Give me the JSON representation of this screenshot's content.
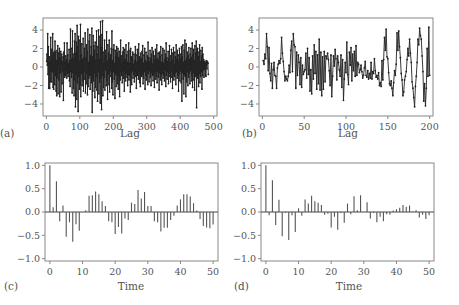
{
  "chart_data": [
    {
      "id": "a",
      "panel_label": "(a)",
      "type": "line",
      "title": "",
      "xlabel": "Lag",
      "ylabel": "",
      "xlim": [
        -10,
        510
      ],
      "ylim": [
        -5.3,
        5.3
      ],
      "xticks": [
        0,
        100,
        200,
        300,
        400,
        500
      ],
      "yticks": [
        -4,
        -2,
        0,
        2,
        4
      ],
      "markers": true,
      "n_points": 500,
      "series_description": "Oscillating time series of 500 points, values roughly between -5 and 5",
      "values": [
        0.6,
        1.4,
        0.2,
        3.6,
        -0.8,
        2.2,
        -2.3,
        0.4,
        1.1,
        -2.3,
        0.5,
        -1.6,
        3.2,
        -0.4,
        1.9,
        -1.6,
        0.8,
        -0.5,
        3.6,
        -2.2,
        1.5,
        -2.4,
        0.2,
        1.7,
        -1.9,
        2.8,
        -0.9,
        1.6,
        -2.6,
        0.7,
        -3.1,
        1.8,
        -1.2,
        2.3,
        -2.9,
        0.3,
        1.5,
        -1.4,
        2.0,
        -3.2,
        0.9,
        -0.6,
        1.7,
        -2.7,
        0.4,
        1.4,
        -1.8,
        0.6,
        -0.4,
        1.1,
        -3.6,
        1.6,
        -0.8,
        2.6,
        -1.1,
        0.5,
        -0.9,
        1.2,
        -0.3,
        0.8,
        -1.2,
        2.6,
        -0.7,
        1.3,
        -1.0,
        0.4,
        -0.6,
        1.9,
        -1.5,
        0.7,
        -2.1,
        4.1,
        -0.5,
        2.0,
        -1.1,
        0.8,
        -2.8,
        3.9,
        -0.6,
        1.4,
        -2.3,
        0.9,
        -3.1,
        2.8,
        -1.4,
        3.6,
        -4.3,
        1.5,
        -0.8,
        2.7,
        -3.5,
        4.5,
        -1.7,
        2.2,
        -4.8,
        3.3,
        -1.0,
        0.6,
        -2.4,
        2.9,
        -1.9,
        4.6,
        -3.2,
        1.3,
        -0.7,
        2.5,
        -2.0,
        0.8,
        -1.5,
        3.1,
        -2.6,
        1.0,
        -0.4,
        2.0,
        -1.3,
        3.7,
        -2.8,
        0.9,
        -1.8,
        2.4,
        -0.6,
        1.7,
        -3.0,
        4.1,
        -2.1,
        0.5,
        -1.2,
        2.8,
        -0.9,
        3.5,
        -2.4,
        1.2,
        -0.8,
        2.2,
        -1.7,
        4.2,
        -4.9,
        1.1,
        -2.6,
        3.4,
        -1.5,
        2.3,
        -0.6,
        1.8,
        -3.3,
        2.7,
        -2.2,
        0.7,
        -1.0,
        3.9,
        -2.5,
        1.4,
        -3.7,
        2.2,
        -0.5,
        4.0,
        -2.9,
        0.8,
        -1.6,
        3.3,
        -3.9,
        4.9,
        -1.2,
        2.1,
        -4.6,
        3.5,
        -0.9,
        5.0,
        -3.1,
        1.6,
        -2.2,
        0.4,
        -1.1,
        2.9,
        -2.5,
        1.8,
        -0.3,
        1.2,
        -2.0,
        3.8,
        -1.4,
        0.6,
        -3.5,
        2.4,
        -0.7,
        1.5,
        -1.9,
        2.9,
        -2.7,
        0.9,
        -0.4,
        1.3,
        -1.0,
        2.0,
        -2.3,
        3.9,
        -1.6,
        0.7,
        -3.0,
        1.9,
        -0.5,
        2.4,
        -1.3,
        0.4,
        -3.4,
        1.8,
        -0.8,
        1.1,
        -2.1,
        2.2,
        -0.6,
        1.5,
        -1.8,
        2.0,
        -2.4,
        1.0,
        -0.9,
        1.7,
        -3.2,
        0.8,
        -1.4,
        2.9,
        -0.5,
        1.2,
        -0.9,
        0.3,
        -1.7,
        1.6,
        -0.4,
        2.1,
        -1.2,
        0.6,
        -2.6,
        1.9,
        -0.3,
        0.8,
        -1.5,
        2.4,
        -0.7,
        1.3,
        -1.1,
        0.5,
        -2.0,
        1.7,
        -0.8,
        2.6,
        -1.4,
        0.4,
        -0.9,
        1.8,
        -2.7,
        2.0,
        -0.6,
        1.1,
        -1.9,
        0.9,
        -0.4,
        1.6,
        -1.2,
        0.3,
        -0.8,
        1.4,
        -1.6,
        0.7,
        -0.5,
        2.2,
        -1.0,
        1.3,
        -2.3,
        0.5,
        -0.7,
        1.9,
        -0.9,
        0.6,
        -1.3,
        2.5,
        -0.4,
        1.1,
        -1.7,
        0.8,
        -2.1,
        1.5,
        -0.6,
        0.9,
        -1.0,
        1.7,
        -0.8,
        2.3,
        -1.8,
        0.4,
        -1.2,
        1.3,
        -0.5,
        2.0,
        -2.4,
        0.7,
        -0.9,
        1.6,
        -1.4,
        0.5,
        -0.3,
        1.2,
        -1.9,
        2.7,
        -0.7,
        1.0,
        -1.6,
        0.6,
        -0.4,
        1.8,
        -1.1,
        0.9,
        -2.0,
        1.4,
        -0.6,
        2.1,
        -0.9,
        0.3,
        -1.5,
        1.7,
        -0.8,
        1.2,
        -2.2,
        0.8,
        -0.5,
        1.9,
        -1.3,
        0.6,
        -1.0,
        2.4,
        -1.7,
        0.9,
        -0.4,
        1.5,
        -1.1,
        0.7,
        -2.5,
        1.6,
        -0.6,
        1.1,
        -1.4,
        2.2,
        -0.8,
        0.5,
        -1.9,
        1.3,
        -0.7,
        2.0,
        -1.2,
        0.4,
        -0.9,
        1.8,
        -1.5,
        0.8,
        -0.3,
        1.4,
        -2.1,
        2.6,
        -0.9,
        1.0,
        -1.3,
        0.6,
        -0.5,
        1.7,
        -1.8,
        0.9,
        -0.7,
        2.3,
        -1.0,
        0.5,
        -1.6,
        1.2,
        -0.4,
        1.9,
        -1.1,
        0.7,
        -2.3,
        1.5,
        -0.8,
        2.1,
        -1.4,
        0.3,
        -1.0,
        1.6,
        -0.6,
        1.1,
        -1.9,
        2.4,
        -0.5,
        0.8,
        -1.2,
        1.8,
        -0.9,
        0.6,
        -2.6,
        1.3,
        -0.7,
        2.0,
        -1.5,
        0.9,
        -0.4,
        1.4,
        -1.7,
        2.2,
        -3.7,
        1.1,
        -0.6,
        2.4,
        -1.3,
        0.5,
        -2.9,
        1.8,
        -0.8,
        2.9,
        -1.0,
        0.7,
        -3.2,
        2.5,
        -1.6,
        0.9,
        -0.5,
        1.6,
        -2.0,
        1.2,
        -1.1,
        2.1,
        -0.7,
        0.8,
        -1.8,
        1.4,
        -0.4,
        2.0,
        -1.5,
        1.0,
        -0.9,
        2.6,
        -2.2,
        1.3,
        -0.6,
        1.9,
        -1.4,
        0.7,
        -2.5,
        2.3,
        -1.0,
        1.5,
        -0.8,
        2.8,
        -4.4,
        1.9,
        -1.2,
        2.0,
        -0.9,
        1.1,
        -2.1,
        1.6,
        -0.7,
        2.4,
        -1.7,
        0.6,
        -1.0,
        1.8,
        -0.5,
        1.2,
        -2.4,
        2.1,
        -0.9,
        1.4,
        -0.3,
        0.8,
        -1.1,
        0.6,
        -0.2,
        0.4,
        -0.9,
        0.5,
        -1.0,
        0.7,
        0.3,
        -0.2,
        0.6,
        0.5,
        0.4,
        -0.8
      ]
    },
    {
      "id": "b",
      "panel_label": "(b)",
      "type": "line",
      "title": "",
      "xlabel": "Lag",
      "ylabel": "",
      "xlim": [
        -4,
        204
      ],
      "ylim": [
        -5.3,
        5.3
      ],
      "xticks": [
        0,
        50,
        100,
        150,
        200
      ],
      "yticks": [
        -4,
        -2,
        0,
        2,
        4
      ],
      "markers": true,
      "n_points": 200,
      "values": [
        0.7,
        0.3,
        1.4,
        0.9,
        3.6,
        2.2,
        -0.4,
        2.1,
        -0.7,
        -1.5,
        0.4,
        -2.3,
        -0.3,
        0.5,
        -0.9,
        -1.0,
        -2.3,
        -0.1,
        0.3,
        0.7,
        0.4,
        0.9,
        3.2,
        1.5,
        0.6,
        -0.5,
        -1.5,
        -1.0,
        -1.3,
        -1.5,
        -1.0,
        0.2,
        -0.6,
        1.8,
        2.8,
        -0.5,
        3.6,
        2.4,
        2.2,
        -2.3,
        1.6,
        -0.9,
        1.3,
        0.5,
        -1.9,
        1.0,
        -2.2,
        0.2,
        -0.8,
        -0.5,
        -0.3,
        1.5,
        -1.2,
        2.0,
        -0.8,
        1.0,
        -2.6,
        -0.3,
        -2.9,
        1.2,
        -1.3,
        2.4,
        -0.7,
        1.7,
        -2.4,
        1.3,
        -1.8,
        3.0,
        -2.5,
        1.6,
        -3.1,
        1.1,
        -2.4,
        1.7,
        -1.6,
        1.2,
        0.9,
        1.5,
        0.8,
        -0.4,
        -2.0,
        1.3,
        -3.2,
        -1.0,
        1.2,
        0.1,
        1.9,
        0.9,
        -1.4,
        1.2,
        0.5,
        -0.3,
        -1.0,
        1.3,
        -2.2,
        0.8,
        -3.6,
        -1.3,
        0.5,
        -0.6,
        2.7,
        -0.8,
        -1.9,
        1.6,
        0.2,
        2.1,
        -1.5,
        1.4,
        -0.4,
        1.7,
        -1.0,
        2.3,
        -0.9,
        0.5,
        0.3,
        -0.6,
        -0.3,
        0.2,
        -0.5,
        -1.2,
        -0.9,
        -0.1,
        0.6,
        -0.9,
        -1.1,
        -0.4,
        -1.3,
        -0.7,
        -1.2,
        0.5,
        -1.3,
        -0.5,
        -0.7,
        0.9,
        -0.4,
        -1.1,
        -0.9,
        -1.3,
        -0.6,
        -2.0,
        -1.7,
        -2.1,
        0.7,
        -1.4,
        0.8,
        3.2,
        1.8,
        4.1,
        1.1,
        0.9,
        -0.6,
        -1.8,
        -2.0,
        -1.5,
        -2.3,
        -3.1,
        -1.7,
        -0.4,
        -0.9,
        0.3,
        3.7,
        1.8,
        3.9,
        2.2,
        1.0,
        -0.7,
        -1.4,
        -3.1,
        -2.7,
        -1.4,
        -1.0,
        -0.5,
        0.8,
        2.0,
        1.2,
        3.0,
        1.5,
        0.5,
        -1.6,
        -2.3,
        -3.3,
        -4.3,
        -2.1,
        -1.0,
        0.5,
        3.0,
        2.4,
        4.2,
        3.4,
        3.0,
        1.2,
        -0.5,
        -3.7,
        -1.8,
        -4.2,
        -2.3,
        2.0,
        -1.0,
        4.3,
        -0.9
      ]
    },
    {
      "id": "c",
      "panel_label": "(c)",
      "type": "bar",
      "title": "",
      "xlabel": "Time",
      "ylabel": "",
      "xlim": [
        -1.5,
        51.5
      ],
      "ylim": [
        -1.05,
        1.05
      ],
      "xticks": [
        0,
        10,
        20,
        30,
        40,
        50
      ],
      "yticks": [
        -1.0,
        -0.5,
        0.0,
        0.5,
        1.0
      ],
      "ytick_labels": [
        "−1.0",
        "−0.5",
        "0.0",
        "0.5",
        "1.0"
      ],
      "x": [
        0,
        1,
        2,
        3,
        4,
        5,
        6,
        7,
        8,
        9,
        10,
        11,
        12,
        13,
        14,
        15,
        16,
        17,
        18,
        19,
        20,
        21,
        22,
        23,
        24,
        25,
        26,
        27,
        28,
        29,
        30,
        31,
        32,
        33,
        34,
        35,
        36,
        37,
        38,
        39,
        40,
        41,
        42,
        43,
        44,
        45,
        46,
        47,
        48,
        49,
        50
      ],
      "values": [
        1.0,
        0.1,
        0.66,
        -0.2,
        0.14,
        -0.53,
        -0.22,
        -0.64,
        -0.26,
        -0.4,
        0.0,
        0.04,
        0.35,
        0.36,
        0.44,
        0.38,
        0.23,
        0.13,
        -0.2,
        -0.22,
        -0.47,
        -0.32,
        -0.46,
        -0.14,
        -0.17,
        0.2,
        0.17,
        0.47,
        0.29,
        0.43,
        0.13,
        0.13,
        -0.2,
        -0.22,
        -0.42,
        -0.34,
        -0.34,
        -0.17,
        -0.08,
        0.14,
        0.27,
        0.38,
        0.38,
        0.33,
        0.19,
        0.03,
        -0.15,
        -0.3,
        -0.33,
        -0.35,
        -0.27
      ]
    },
    {
      "id": "d",
      "panel_label": "(d)",
      "type": "bar",
      "title": "",
      "xlabel": "Time",
      "ylabel": "",
      "xlim": [
        -1.5,
        51.5
      ],
      "ylim": [
        -1.05,
        1.05
      ],
      "xticks": [
        0,
        10,
        20,
        30,
        40,
        50
      ],
      "yticks": [
        -1.0,
        -0.5,
        0.0,
        0.5,
        1.0
      ],
      "ytick_labels": [
        "−1.0",
        "−0.5",
        "0.0",
        "0.5",
        "1.0"
      ],
      "x": [
        0,
        1,
        2,
        3,
        4,
        5,
        6,
        7,
        8,
        9,
        10,
        11,
        12,
        13,
        14,
        15,
        16,
        17,
        18,
        19,
        20,
        21,
        22,
        23,
        24,
        25,
        26,
        27,
        28,
        29,
        30,
        31,
        32,
        33,
        34,
        35,
        36,
        37,
        38,
        39,
        40,
        41,
        42,
        43,
        44,
        45,
        46,
        47,
        48,
        49,
        50
      ],
      "values": [
        1.0,
        -0.07,
        0.68,
        -0.28,
        0.26,
        -0.52,
        -0.02,
        -0.6,
        -0.07,
        -0.43,
        0.08,
        -0.08,
        0.27,
        0.18,
        0.35,
        0.23,
        0.2,
        0.15,
        -0.06,
        -0.04,
        -0.33,
        -0.1,
        -0.38,
        -0.02,
        -0.23,
        0.18,
        -0.05,
        0.34,
        0.04,
        0.36,
        0.0,
        0.21,
        -0.14,
        -0.02,
        -0.22,
        -0.1,
        -0.2,
        -0.05,
        -0.06,
        0.03,
        0.06,
        0.09,
        0.15,
        0.11,
        0.14,
        0.01,
        0.04,
        -0.12,
        -0.06,
        -0.15,
        -0.07
      ]
    }
  ],
  "layout": {
    "panels": {
      "a": {
        "box": [
          43,
          18,
          217,
          116
        ],
        "label_pos": [
          0,
          137
        ],
        "xlabel_pos": [
          130,
          137
        ]
      },
      "b": {
        "box": [
          259,
          18,
          433,
          116
        ],
        "label_pos": [
          242,
          137
        ],
        "xlabel_pos": [
          348,
          137
        ]
      },
      "c": {
        "box": [
          45,
          163,
          218,
          261
        ],
        "label_pos": [
          4,
          290
        ],
        "xlabel_pos": [
          131,
          290
        ]
      },
      "d": {
        "box": [
          261,
          163,
          434,
          261
        ],
        "label_pos": [
          234,
          290
        ],
        "xlabel_pos": [
          349,
          290
        ]
      }
    },
    "colors": {
      "axis": "#888888",
      "series": "#222222",
      "bar": "#555555",
      "text": "#555555"
    }
  }
}
